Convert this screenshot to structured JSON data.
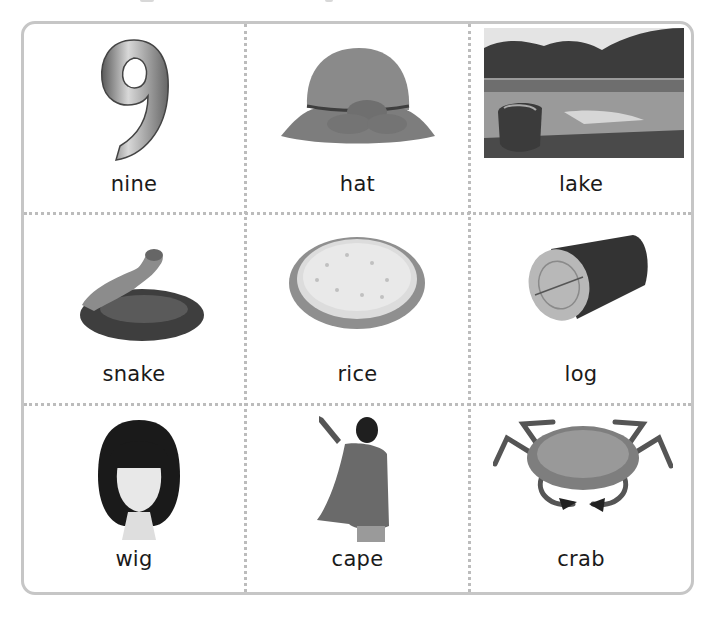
{
  "worksheet": {
    "grid": {
      "rows": 3,
      "columns": 3,
      "border_color": "#c6c6c6",
      "divider_color": "#bcbcbc"
    },
    "cards": [
      {
        "word": "nine",
        "picture": "number-nine-balloon"
      },
      {
        "word": "hat",
        "picture": "felt-hat"
      },
      {
        "word": "lake",
        "picture": "lake-with-boat-photo"
      },
      {
        "word": "snake",
        "picture": "coiled-snake"
      },
      {
        "word": "rice",
        "picture": "plate-of-rice"
      },
      {
        "word": "log",
        "picture": "wood-log"
      },
      {
        "word": "wig",
        "picture": "wig-on-mannequin"
      },
      {
        "word": "cape",
        "picture": "child-in-cape"
      },
      {
        "word": "crab",
        "picture": "crab"
      }
    ]
  }
}
